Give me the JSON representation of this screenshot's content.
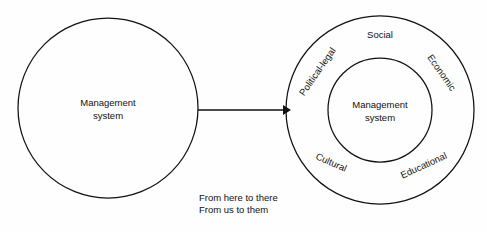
{
  "diagram": {
    "title": "",
    "background_color": "#fefefe",
    "stroke_color": "#111111",
    "left_node": {
      "name": "management-system-left",
      "line1": "Management",
      "line2": "system",
      "cx": 108,
      "cy": 108,
      "r": 90
    },
    "right_node": {
      "name": "management-system-right",
      "line1": "Management",
      "line2": "system",
      "cx": 380,
      "cy": 110,
      "inner_r": 52,
      "outer_r": 94
    },
    "arrow": {
      "name": "transition-arrow",
      "x1": 198,
      "y1": 110,
      "x2": 288,
      "y2": 110
    },
    "environment_labels": [
      {
        "id": "social",
        "text": "Social",
        "x": 380,
        "y": 35,
        "rotation": 0
      },
      {
        "id": "political-legal",
        "text": "Political-legal",
        "x": 318,
        "y": 72,
        "rotation": -55
      },
      {
        "id": "economic",
        "text": "Economic",
        "x": 441,
        "y": 73,
        "rotation": 55
      },
      {
        "id": "cultural",
        "text": "Cultural",
        "x": 331,
        "y": 163,
        "rotation": 24
      },
      {
        "id": "educational",
        "text": "Educational",
        "x": 424,
        "y": 166,
        "rotation": -25
      }
    ],
    "caption": {
      "name": "transition-caption",
      "line1": "From here to there",
      "line2": "From us to them",
      "x": 199,
      "y1": 198,
      "y2": 210
    }
  }
}
